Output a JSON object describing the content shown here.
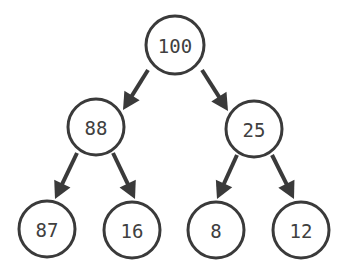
{
  "diagram": {
    "type": "binary-tree",
    "colors": {
      "stroke": "#3a3a3a",
      "text": "#404040",
      "background": "#ffffff",
      "node_fill": "#ffffff"
    },
    "nodes": [
      {
        "id": "n0",
        "label": "100",
        "cx": 175,
        "cy": 45,
        "r": 29
      },
      {
        "id": "n1",
        "label": "88",
        "cx": 96,
        "cy": 127,
        "r": 28
      },
      {
        "id": "n2",
        "label": "25",
        "cx": 254,
        "cy": 129,
        "r": 28
      },
      {
        "id": "n3",
        "label": "87",
        "cx": 47,
        "cy": 229,
        "r": 28
      },
      {
        "id": "n4",
        "label": "16",
        "cx": 132,
        "cy": 230,
        "r": 28
      },
      {
        "id": "n5",
        "label": "8",
        "cx": 216,
        "cy": 230,
        "r": 28
      },
      {
        "id": "n6",
        "label": "12",
        "cx": 301,
        "cy": 230,
        "r": 28
      }
    ],
    "edges": [
      {
        "from": "n0",
        "to": "n1",
        "from_label": "100",
        "to_label": "88",
        "x1": 148,
        "y1": 70,
        "x2": 123,
        "y2": 110
      },
      {
        "from": "n0",
        "to": "n2",
        "from_label": "100",
        "to_label": "25",
        "x1": 202,
        "y1": 70,
        "x2": 228,
        "y2": 111
      },
      {
        "from": "n1",
        "to": "n3",
        "from_label": "88",
        "to_label": "87",
        "x1": 77,
        "y1": 153,
        "x2": 55,
        "y2": 199
      },
      {
        "from": "n1",
        "to": "n4",
        "from_label": "88",
        "to_label": "16",
        "x1": 113,
        "y1": 153,
        "x2": 135,
        "y2": 199
      },
      {
        "from": "n2",
        "to": "n5",
        "from_label": "25",
        "to_label": "8",
        "x1": 237,
        "y1": 155,
        "x2": 217,
        "y2": 199
      },
      {
        "from": "n2",
        "to": "n6",
        "from_label": "25",
        "to_label": "12",
        "x1": 272,
        "y1": 155,
        "x2": 294,
        "y2": 199
      }
    ]
  }
}
